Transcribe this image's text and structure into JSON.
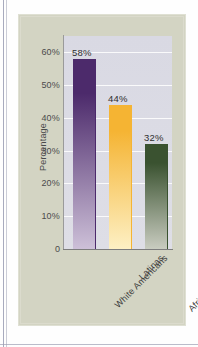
{
  "chart_data": {
    "type": "bar",
    "title": "",
    "subtitle": "",
    "xlabel": "",
    "ylabel": "Percentage",
    "ylim": [
      0,
      65
    ],
    "ytick_values": [
      0,
      10,
      20,
      30,
      40,
      50,
      60
    ],
    "ytick_labels": [
      "0",
      "10%",
      "20%",
      "30%",
      "40%",
      "50%",
      "60%"
    ],
    "grid": true,
    "legend": "none",
    "categories": [
      "White Americans",
      "Latinas",
      "African Americans"
    ],
    "values": [
      58,
      44,
      32
    ],
    "value_labels": [
      "58%",
      "44%",
      "32%"
    ],
    "bar_colors": [
      "#4c2a6b",
      "#f5b433",
      "#3a5230"
    ],
    "bar_colors_bottom": [
      "#cdc0d8",
      "#fdf0c4",
      "#c9ccc0"
    ]
  },
  "figure": {
    "panel_color": "#d3d4c3",
    "plot_background": "#dcdce4",
    "axis_color": "#8f8f8f",
    "gridline_color": "#ffffff",
    "page_background": "#ffffff"
  }
}
